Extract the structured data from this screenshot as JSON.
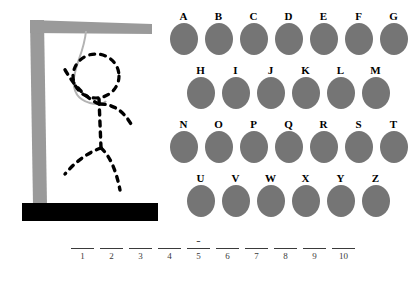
{
  "app": {
    "title": "Hangman"
  },
  "gallows": {
    "post_color": "#9a9a9a",
    "beam_color": "#9a9a9a",
    "base_color": "#000000",
    "rope_color": "#b0b0b0",
    "figure_color": "#000000",
    "parts_drawn": [
      "post",
      "beam",
      "base",
      "rope",
      "head",
      "body",
      "left-arm",
      "right-arm",
      "left-leg",
      "right-leg"
    ],
    "label_post": "gallows-post",
    "label_beam": "gallows-beam",
    "label_base": "gallows-base",
    "label_rope": "noose-rope",
    "label_figure": "hangman-figure"
  },
  "keyboard": {
    "disc_color": "#757575",
    "rows": [
      {
        "indented": false,
        "letters": [
          "A",
          "B",
          "C",
          "D",
          "E",
          "F",
          "G"
        ]
      },
      {
        "indented": true,
        "letters": [
          "H",
          "I",
          "J",
          "K",
          "L",
          "M"
        ]
      },
      {
        "indented": false,
        "letters": [
          "N",
          "O",
          "P",
          "Q",
          "R",
          "S",
          "T"
        ]
      },
      {
        "indented": true,
        "letters": [
          "U",
          "V",
          "W",
          "X",
          "Y",
          "Z"
        ]
      }
    ]
  },
  "word": {
    "length": 10,
    "slots": [
      {
        "index": "1",
        "char": ""
      },
      {
        "index": "2",
        "char": ""
      },
      {
        "index": "3",
        "char": ""
      },
      {
        "index": "4",
        "char": ""
      },
      {
        "index": "5",
        "char": "-"
      },
      {
        "index": "6",
        "char": ""
      },
      {
        "index": "7",
        "char": ""
      },
      {
        "index": "8",
        "char": ""
      },
      {
        "index": "9",
        "char": ""
      },
      {
        "index": "10",
        "char": ""
      }
    ]
  }
}
